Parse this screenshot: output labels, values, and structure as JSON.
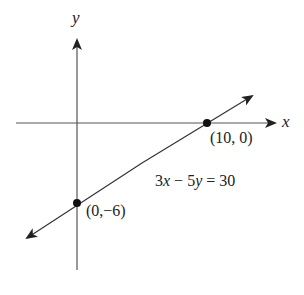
{
  "figure": {
    "panel_label": "(c)",
    "axes": {
      "x_label": "x",
      "y_label": "y"
    },
    "points": [
      {
        "label": "(10, 0)",
        "x": 10,
        "y": 0
      },
      {
        "label": "(0,−6)",
        "x": 0,
        "y": -6
      }
    ],
    "equation": {
      "lhs_a": "3",
      "var_x": "x",
      "op": " − ",
      "lhs_b": "5",
      "var_y": "y",
      "rhs": " = 30"
    },
    "colors": {
      "ink": "#222222",
      "axis": "#555555",
      "background": "#ffffff"
    }
  }
}
